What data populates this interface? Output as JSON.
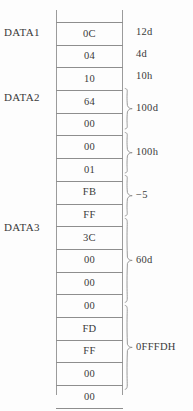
{
  "figure": {
    "kind": "memory-layout-diagram",
    "background_color": "#fdfdfd",
    "line_color": "#8e8e8e",
    "text_color": "#3a3a3a"
  },
  "memory": {
    "cells": [
      {
        "value": "0C"
      },
      {
        "value": "04"
      },
      {
        "value": "10"
      },
      {
        "value": "64"
      },
      {
        "value": "00"
      },
      {
        "value": "00"
      },
      {
        "value": "01"
      },
      {
        "value": "FB"
      },
      {
        "value": "FF"
      },
      {
        "value": "3C"
      },
      {
        "value": "00"
      },
      {
        "value": "00"
      },
      {
        "value": "00"
      },
      {
        "value": "FD"
      },
      {
        "value": "FF"
      },
      {
        "value": "00"
      },
      {
        "value": "00"
      }
    ]
  },
  "labels": [
    {
      "text": "DATA1",
      "cell_index": 0
    },
    {
      "text": "DATA2",
      "cell_index": 3
    },
    {
      "text": "DATA3",
      "cell_index": 9
    }
  ],
  "single_notes": [
    {
      "text": "12d",
      "cell_index": 0
    },
    {
      "text": "4d",
      "cell_index": 1
    },
    {
      "text": "10h",
      "cell_index": 2
    }
  ],
  "grouped_notes": [
    {
      "text": "100d",
      "start_index": 3,
      "span": 2
    },
    {
      "text": "100h",
      "start_index": 5,
      "span": 2
    },
    {
      "text": "−5",
      "start_index": 7,
      "span": 2
    },
    {
      "text": "60d",
      "start_index": 9,
      "span": 4
    },
    {
      "text": "0FFFDH",
      "start_index": 13,
      "span": 4
    }
  ]
}
